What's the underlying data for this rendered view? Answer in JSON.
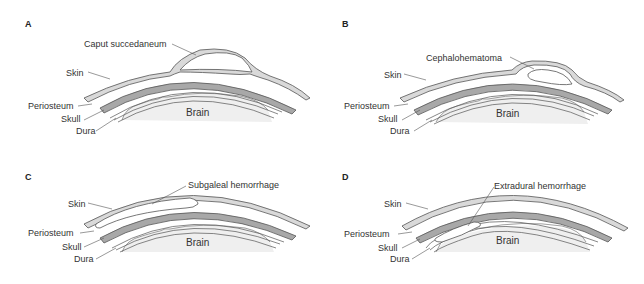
{
  "colors": {
    "skin": "#d9d9d9",
    "skull": "#a8a8a8",
    "brain": "#efefef",
    "outline": "#555555",
    "text": "#333333"
  },
  "panels": [
    {
      "letter": "A",
      "lesion_label": "Caput succedaneum",
      "labels": {
        "skin": "Skin",
        "periosteum": "Periosteum",
        "skull": "Skull",
        "dura": "Dura",
        "brain": "Brain"
      }
    },
    {
      "letter": "B",
      "lesion_label": "Cephalohematoma",
      "labels": {
        "skin": "Skin",
        "periosteum": "Periosteum",
        "skull": "Skull",
        "dura": "Dura",
        "brain": "Brain"
      }
    },
    {
      "letter": "C",
      "lesion_label": "Subgaleal hemorrhage",
      "labels": {
        "skin": "Skin",
        "periosteum": "Periosteum",
        "skull": "Skull",
        "dura": "Dura",
        "brain": "Brain"
      }
    },
    {
      "letter": "D",
      "lesion_label": "Extradural hemorrhage",
      "labels": {
        "skin": "Skin",
        "periosteum": "Periosteum",
        "skull": "Skull",
        "dura": "Dura",
        "brain": "Brain"
      }
    }
  ]
}
